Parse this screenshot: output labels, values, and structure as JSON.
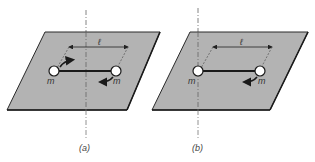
{
  "figure": {
    "panels": [
      {
        "id": "a",
        "caption": "(a)",
        "length_label": "ℓ",
        "mass_left_label": "m",
        "mass_right_label": "m",
        "description": "Dumbbell rotating about vertical axis through its center",
        "rotation_arrows": [
          "left-mass-up-right",
          "right-mass-down-left"
        ]
      },
      {
        "id": "b",
        "caption": "(b)",
        "length_label": "ℓ",
        "mass_left_label": "m",
        "mass_right_label": "m",
        "description": "Dumbbell rotating about vertical axis through left mass",
        "rotation_arrows": [
          "right-mass-down-left"
        ]
      }
    ],
    "colors": {
      "plane_fill": "#b3b3b3",
      "plane_edge": "#2a2a2a",
      "mass_fill": "#ffffff",
      "rod": "#1a1a1a",
      "axis": "#666666"
    }
  }
}
